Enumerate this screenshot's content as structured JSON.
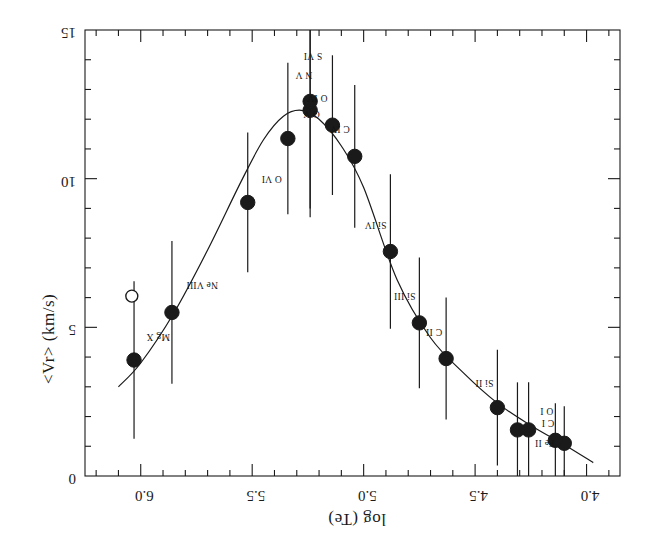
{
  "figure": {
    "orientation_degrees": 180,
    "background_color": "#ffffff",
    "ink_color": "#1a1a1a"
  },
  "chart_data": {
    "type": "scatter",
    "title": "",
    "subtitle": "",
    "xlabel": "log (Te)",
    "ylabel": "<Vr>  (km/s)",
    "xlim": [
      3.85,
      6.25
    ],
    "ylim": [
      0,
      15
    ],
    "y_axis_inverted": true,
    "xticks": [
      4.0,
      4.5,
      5.0,
      5.5,
      6.0
    ],
    "xtick_labels": [
      "4.0",
      "4.5",
      "5.0",
      "5.5",
      "6.0"
    ],
    "xminor_ticks": [
      3.9,
      4.1,
      4.2,
      4.3,
      4.4,
      4.6,
      4.7,
      4.8,
      4.9,
      5.1,
      5.2,
      5.3,
      5.4,
      5.6,
      5.7,
      5.8,
      5.9,
      6.1,
      6.2
    ],
    "yticks": [
      0,
      5,
      10,
      15
    ],
    "ytick_labels": [
      "0",
      "5",
      "10",
      "15"
    ],
    "yminor_ticks": [
      1,
      2,
      3,
      4,
      6,
      7,
      8,
      9,
      11,
      12,
      13,
      14
    ],
    "grid": false,
    "legend": false,
    "legend_position": "none",
    "marker_style": "filled-circle",
    "error_bar_direction": "vertical",
    "points": [
      {
        "label": "C I",
        "x": 4.1,
        "y": 1.1,
        "yerr": 1.25,
        "marker": "filled",
        "label_dx": 10,
        "label_dy": 15
      },
      {
        "label": "O I",
        "x": 4.14,
        "y": 1.2,
        "yerr": 1.25,
        "marker": "filled",
        "label_dx": 2,
        "label_dy": 24
      },
      {
        "label": "Fe II",
        "x": 4.26,
        "y": 1.55,
        "yerr": 1.6,
        "marker": "filled",
        "label_dx": -26,
        "label_dy": -18
      },
      {
        "label": "Fe II b",
        "x": 4.31,
        "y": 1.55,
        "yerr": 1.6,
        "marker": "filled",
        "label_dx": 0,
        "label_dy": 0
      },
      {
        "label": "Si II",
        "x": 4.4,
        "y": 2.3,
        "yerr": 1.95,
        "marker": "filled",
        "label_dx": 4,
        "label_dy": 20
      },
      {
        "label": "C II",
        "x": 4.63,
        "y": 3.95,
        "yerr": 2.05,
        "marker": "filled",
        "label_dx": 4,
        "label_dy": 22
      },
      {
        "label": "Si III",
        "x": 4.75,
        "y": 5.15,
        "yerr": 2.2,
        "marker": "filled",
        "label_dx": 4,
        "label_dy": 22
      },
      {
        "label": "Si IV",
        "x": 4.88,
        "y": 7.55,
        "yerr": 2.6,
        "marker": "filled",
        "label_dx": 4,
        "label_dy": 22
      },
      {
        "label": "C IV",
        "x": 5.04,
        "y": 10.75,
        "yerr": 2.4,
        "marker": "filled",
        "label_dx": 5,
        "label_dy": 22
      },
      {
        "label": "O IV",
        "x": 5.14,
        "y": 11.8,
        "yerr": 2.35,
        "marker": "filled",
        "label_dx": 5,
        "label_dy": 22
      },
      {
        "label": "N V",
        "x": 5.24,
        "y": 12.3,
        "yerr": 3.6,
        "marker": "filled",
        "label_dx": -2,
        "label_dy": 30
      },
      {
        "label": "S VI",
        "x": 5.24,
        "y": 12.6,
        "yerr": 3.6,
        "marker": "filled",
        "label_dx": -12,
        "label_dy": 40
      },
      {
        "label": "O V",
        "x": 5.34,
        "y": 11.35,
        "yerr": 2.55,
        "marker": "filled",
        "label_dx": -32,
        "label_dy": 20
      },
      {
        "label": "O VI",
        "x": 5.52,
        "y": 9.2,
        "yerr": 2.35,
        "marker": "filled",
        "label_dx": -34,
        "label_dy": 18
      },
      {
        "label": "Ne VIII",
        "x": 5.86,
        "y": 5.5,
        "yerr": 2.4,
        "marker": "filled",
        "label_dx": -46,
        "label_dy": 22
      },
      {
        "label": "Mg X",
        "x": 6.03,
        "y": 3.9,
        "yerr": 2.65,
        "marker": "filled",
        "label_dx": -36,
        "label_dy": 18
      },
      {
        "label": "",
        "x": 6.04,
        "y": 6.05,
        "yerr": 0,
        "marker": "open",
        "label_dx": 0,
        "label_dy": 0
      }
    ],
    "fit_curve": {
      "description": "smooth fitted curve through ion points",
      "x": [
        3.97,
        4.1,
        4.25,
        4.4,
        4.55,
        4.7,
        4.85,
        5.0,
        5.1,
        5.2,
        5.28,
        5.36,
        5.45,
        5.55,
        5.7,
        5.85,
        6.0,
        6.1
      ],
      "y": [
        0.45,
        1.05,
        1.7,
        2.45,
        3.45,
        4.65,
        6.6,
        9.7,
        11.1,
        12.0,
        12.3,
        12.1,
        11.3,
        9.9,
        7.6,
        5.5,
        3.8,
        3.0
      ]
    }
  },
  "axis_titles": {
    "x": "log (Te)",
    "y": "<Vr>  (km/s)"
  }
}
